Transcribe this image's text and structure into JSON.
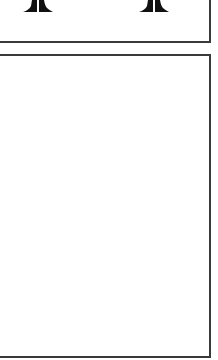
{
  "top_panel": {
    "icons": [
      {
        "name": "column-base-icon",
        "position": "left"
      },
      {
        "name": "column-base-icon",
        "position": "right"
      }
    ]
  },
  "main_panel": {
    "content": ""
  },
  "colors": {
    "border": "#3a3a3a",
    "icon": "#111111",
    "background": "#ffffff"
  }
}
